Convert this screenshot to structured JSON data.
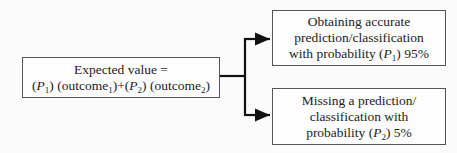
{
  "left_box": {
    "line1": "Expected value =",
    "p1": "P",
    "p1_sub": "1",
    "outcome1": "(outcome",
    "outcome1_sub": "1",
    "p2": "P",
    "p2_sub": "2",
    "outcome2": "(outcome",
    "outcome2_sub": "2"
  },
  "top_box": {
    "line1": "Obtaining accurate",
    "line2": "prediction/classification",
    "line3_pre": "with probability (",
    "p": "P",
    "p_sub": "1",
    "line3_post": ") 95%"
  },
  "bottom_box": {
    "line1": "Missing a prediction/",
    "line2": "classification with",
    "line3_pre": "probability (",
    "p": "P",
    "p_sub": "2",
    "line3_post": ") 5%"
  }
}
